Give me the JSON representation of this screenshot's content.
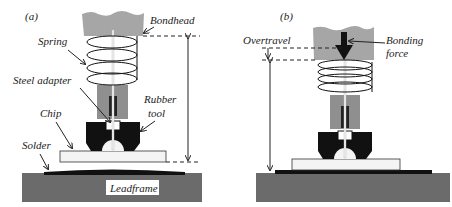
{
  "panels": [
    {
      "id": "a",
      "tag": "(a)",
      "labels": {
        "bondhead": "Bondhead",
        "spring": "Spring",
        "steel_adapter": "Steel adapter",
        "rubber_tool_1": "Rubber",
        "rubber_tool_2": "tool",
        "chip": "Chip",
        "solder": "Solder",
        "leadframe": "Leadframe"
      }
    },
    {
      "id": "b",
      "tag": "(b)",
      "labels": {
        "overtravel": "Overtravel",
        "bonding_force_1": "Bonding",
        "bonding_force_2": "force"
      }
    }
  ],
  "colors": {
    "bondhead": "#a6a6a6",
    "adapter": "#8f8f8f",
    "tool": "#111111",
    "leadframe": "#6b6b6b",
    "chip": "#f4f4f4",
    "solder": "#111111"
  }
}
